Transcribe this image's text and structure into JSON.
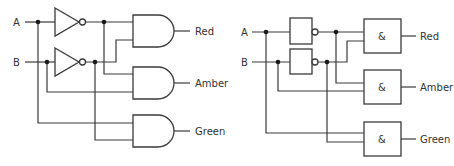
{
  "diagrams": [
    {
      "name": "traffic-light-logic-distinctive-shapes",
      "inputs": [
        {
          "label": "A"
        },
        {
          "label": "B"
        }
      ],
      "outputs": [
        {
          "label": "Red"
        },
        {
          "label": "Amber"
        },
        {
          "label": "Green"
        }
      ],
      "gates": [
        {
          "type": "NOT",
          "input": "A"
        },
        {
          "type": "NOT",
          "input": "B"
        },
        {
          "type": "AND",
          "inputs": [
            "NOT A",
            "NOT B"
          ],
          "output": "Red"
        },
        {
          "type": "AND",
          "inputs": [
            "NOT A",
            "B"
          ],
          "output": "Amber"
        },
        {
          "type": "AND",
          "inputs": [
            "A",
            "NOT B"
          ],
          "output": "Green"
        }
      ]
    },
    {
      "name": "traffic-light-logic-rectangular-shapes",
      "inputs": [
        {
          "label": "A"
        },
        {
          "label": "B"
        }
      ],
      "outputs": [
        {
          "label": "Red"
        },
        {
          "label": "Amber"
        },
        {
          "label": "Green"
        }
      ],
      "and_symbol": "&",
      "gates": [
        {
          "type": "NOT",
          "input": "A"
        },
        {
          "type": "NOT",
          "input": "B"
        },
        {
          "type": "AND",
          "inputs": [
            "NOT A",
            "NOT B"
          ],
          "output": "Red"
        },
        {
          "type": "AND",
          "inputs": [
            "NOT A",
            "B"
          ],
          "output": "Amber"
        },
        {
          "type": "AND",
          "inputs": [
            "A",
            "NOT B"
          ],
          "output": "Green"
        }
      ]
    }
  ]
}
